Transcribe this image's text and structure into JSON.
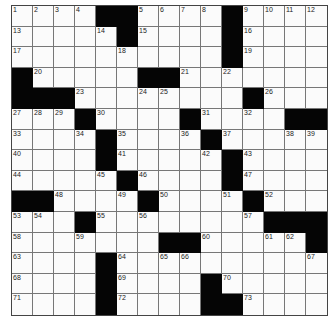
{
  "puzzle": {
    "rows": 15,
    "cols": 15,
    "colors": {
      "block": "#050505",
      "cell": "#fbfbfb",
      "line": "#777777"
    },
    "grid": [
      [
        "1",
        "2",
        "3",
        "4",
        "#",
        "#",
        "5",
        "6",
        "7",
        "8",
        "#",
        "9",
        "10",
        "11",
        "12"
      ],
      [
        "13",
        "",
        "",
        "",
        "14",
        "#",
        "15",
        "",
        "",
        "",
        "#",
        "16",
        "",
        "",
        ""
      ],
      [
        "17",
        "",
        "",
        "",
        "",
        "18",
        "",
        "",
        "",
        "",
        "#",
        "19",
        "",
        "",
        ""
      ],
      [
        "#",
        "20",
        "",
        "",
        "",
        "",
        "#",
        "#",
        "21",
        "",
        "22",
        "",
        "",
        "",
        ""
      ],
      [
        "#",
        "#",
        "#",
        "23",
        "",
        "",
        "24",
        "25",
        "",
        "",
        "",
        "#",
        "26",
        "",
        ""
      ],
      [
        "27",
        "28",
        "29",
        "#",
        "30",
        "",
        "",
        "",
        "#",
        "31",
        "",
        "32",
        "",
        "#",
        "#"
      ],
      [
        "33",
        "",
        "",
        "34",
        "#",
        "35",
        "",
        "",
        "36",
        "#",
        "37",
        "",
        "",
        "38",
        "39"
      ],
      [
        "40",
        "",
        "",
        "",
        "#",
        "41",
        "",
        "",
        "",
        "42",
        "#",
        "43",
        "",
        "",
        ""
      ],
      [
        "44",
        "",
        "",
        "",
        "45",
        "#",
        "46",
        "",
        "",
        "",
        "#",
        "47",
        "",
        "",
        ""
      ],
      [
        "#",
        "#",
        "48",
        "",
        "",
        "49",
        "#",
        "50",
        "",
        "",
        "51",
        "#",
        "52",
        "",
        ""
      ],
      [
        "53",
        "54",
        "",
        "#",
        "55",
        "",
        "56",
        "",
        "",
        "",
        "",
        "57",
        "#",
        "#",
        "#"
      ],
      [
        "58",
        "",
        "",
        "59",
        "",
        "",
        "",
        "#",
        "#",
        "60",
        "",
        "",
        "61",
        "62",
        "#"
      ],
      [
        "63",
        "",
        "",
        "",
        "#",
        "64",
        "",
        "65",
        "66",
        "",
        "",
        "",
        "",
        "",
        "67"
      ],
      [
        "68",
        "",
        "",
        "",
        "#",
        "69",
        "",
        "",
        "",
        "#",
        "70",
        "",
        "",
        "",
        ""
      ],
      [
        "71",
        "",
        "",
        "",
        "#",
        "72",
        "",
        "",
        "",
        "#",
        "#",
        "73",
        "",
        "",
        ""
      ]
    ]
  }
}
